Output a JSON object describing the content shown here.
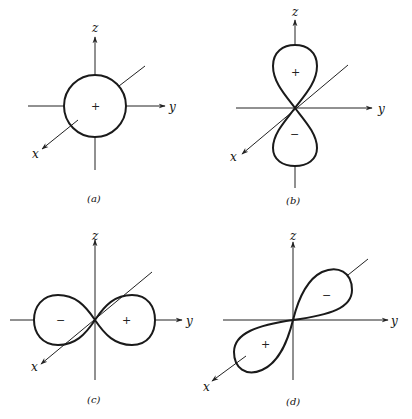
{
  "figure": {
    "panels": [
      {
        "id": "a",
        "caption": "(a)",
        "orbital": "s",
        "axes": {
          "z": "z",
          "y": "y",
          "x": "x"
        },
        "signs": [
          "+"
        ]
      },
      {
        "id": "b",
        "caption": "(b)",
        "orbital": "pz",
        "axes": {
          "z": "z",
          "y": "y",
          "x": "x"
        },
        "signs": [
          "+",
          "−"
        ]
      },
      {
        "id": "c",
        "caption": "(c)",
        "orbital": "py",
        "axes": {
          "z": "z",
          "y": "y",
          "x": "x"
        },
        "signs": [
          "−",
          "+"
        ]
      },
      {
        "id": "d",
        "caption": "(d)",
        "orbital": "px",
        "axes": {
          "z": "z",
          "y": "y",
          "x": "x"
        },
        "signs": [
          "−",
          "+"
        ]
      }
    ]
  },
  "colors": {
    "ink": "#1a1a1a",
    "background": "#ffffff"
  }
}
